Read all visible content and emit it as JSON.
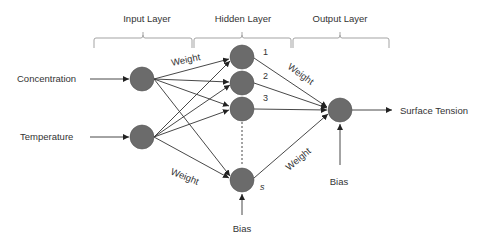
{
  "layers": {
    "input": "Input Layer",
    "hidden": "Hidden Layer",
    "output": "Output Layer"
  },
  "inputs": {
    "concentration": "Concentration",
    "temperature": "Temperature"
  },
  "hidden_nodes": {
    "n1": "1",
    "n2": "2",
    "n3": "3",
    "ns": "s"
  },
  "weights": {
    "top_input": "Weight",
    "bottom_input": "Weight",
    "top_output": "Weight",
    "bottom_output": "Weight"
  },
  "bias": {
    "hidden": "Bias",
    "output": "Bias"
  },
  "output": {
    "label": "Surface Tension"
  },
  "colors": {
    "node_fill": "#6b6b6b",
    "line": "#333333",
    "bracket": "#999999"
  }
}
